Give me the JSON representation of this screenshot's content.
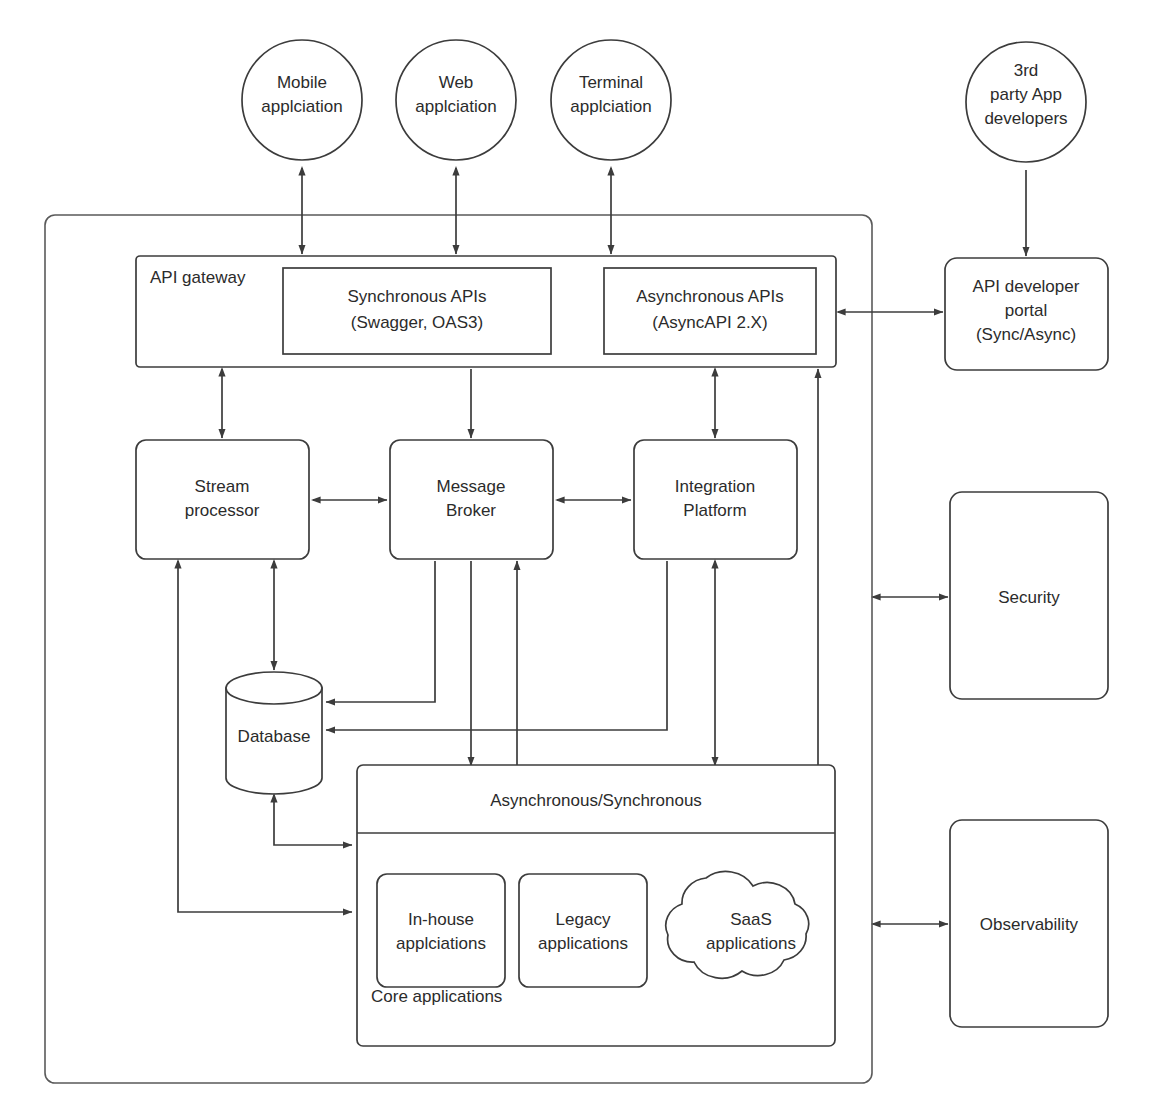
{
  "diagram": {
    "stroke_color": "#3c3c3c",
    "background_color": "#ffffff",
    "consumers": [
      {
        "id": "mobile",
        "label_line1": "Mobile",
        "label_line2": "applciation"
      },
      {
        "id": "web",
        "label_line1": "Web",
        "label_line2": "applciation"
      },
      {
        "id": "terminal",
        "label_line1": "Terminal",
        "label_line2": "applciation"
      }
    ],
    "third_party": {
      "id": "third-party-app-developers",
      "label_line1": "3rd",
      "label_line2": "party App",
      "label_line3": "developers"
    },
    "gateway": {
      "id": "api-gateway",
      "label": "API gateway",
      "apis": [
        {
          "id": "synchronous-apis",
          "label_line1": "Synchronous APIs",
          "label_line2": "(Swagger, OAS3)"
        },
        {
          "id": "asynchronous-apis",
          "label_line1": "Asynchronous APIs",
          "label_line2": "(AsyncAPI 2.X)"
        }
      ]
    },
    "developer_portal": {
      "id": "api-developer-portal",
      "label_line1": "API developer",
      "label_line2": "portal",
      "label_line3": "(Sync/Async)"
    },
    "middleware": [
      {
        "id": "stream-processor",
        "label_line1": "Stream",
        "label_line2": "processor"
      },
      {
        "id": "message-broker",
        "label_line1": "Message",
        "label_line2": "Broker"
      },
      {
        "id": "integration-platform",
        "label_line1": "Integration",
        "label_line2": "Platform"
      }
    ],
    "database": {
      "id": "database",
      "label": "Database"
    },
    "core": {
      "id": "core-applications",
      "band_label": "Asynchronous/Synchronous",
      "group_label": "Core applications",
      "apps": [
        {
          "id": "in-house-applications",
          "shape": "rounded-rect",
          "label_line1": "In-house",
          "label_line2": "applciations"
        },
        {
          "id": "legacy-applications",
          "shape": "rounded-rect",
          "label_line1": "Legacy",
          "label_line2": "applications"
        },
        {
          "id": "saas-applications",
          "shape": "cloud",
          "label_line1": "SaaS",
          "label_line2": "applications"
        }
      ]
    },
    "cross_cutting": [
      {
        "id": "security",
        "label": "Security"
      },
      {
        "id": "observability",
        "label": "Observability"
      }
    ]
  }
}
